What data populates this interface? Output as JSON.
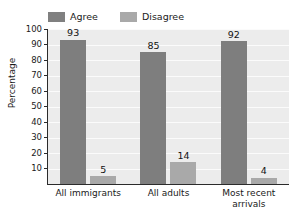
{
  "chart_data": {
    "type": "bar",
    "title": "",
    "subtitle": "",
    "xlabel": "",
    "ylabel": "Percentage",
    "ylim": [
      0,
      100
    ],
    "ytick_values": [
      10,
      20,
      30,
      40,
      50,
      60,
      70,
      80,
      90,
      100
    ],
    "ytick_labels": [
      "10",
      "20",
      "30",
      "40",
      "50",
      "60",
      "70",
      "80",
      "90",
      "100"
    ],
    "grid": true,
    "grid_orientation": "horizontal",
    "legend_position": "top-left",
    "categories": [
      "All immigrants",
      "All adults",
      "Most recent arrivals"
    ],
    "category_lines": [
      [
        "All immigrants"
      ],
      [
        "All adults"
      ],
      [
        "Most recent",
        "arrivals"
      ]
    ],
    "series": [
      {
        "name": "Agree",
        "color": "#7e7e7e",
        "values": [
          93,
          85,
          92
        ]
      },
      {
        "name": "Disagree",
        "color": "#a9a9a9",
        "values": [
          5,
          14,
          4
        ]
      }
    ],
    "data_labels": [
      "93",
      "5",
      "85",
      "14",
      "92",
      "4"
    ],
    "plot_background": "#ececec",
    "gridline_color": "#fbfbfb",
    "axis_color": "#2b2b2b",
    "text_color": "#1a1a1a"
  },
  "legend": {
    "entries": [
      {
        "label": "Agree",
        "swatch_class": "agree"
      },
      {
        "label": "Disagree",
        "swatch_class": "disagree"
      }
    ]
  }
}
